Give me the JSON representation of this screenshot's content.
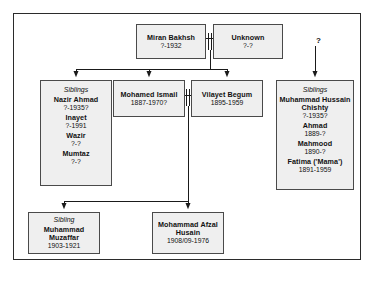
{
  "diagram": {
    "type": "family-tree",
    "title": "",
    "unknown_link_label": "?",
    "nodes": [
      {
        "id": "miran",
        "kind": "person",
        "name": "Miran Bakhsh",
        "dates": "?-1932"
      },
      {
        "id": "unknown",
        "kind": "person",
        "name": "Unknown",
        "dates": "?-?"
      },
      {
        "id": "siblings_left",
        "kind": "sibling-group",
        "header": "Siblings",
        "members": [
          {
            "name": "Nazir Ahmad",
            "dates": "?-1935?"
          },
          {
            "name": "Inayet",
            "dates": "?-1991"
          },
          {
            "name": "Wazir",
            "dates": "?-?"
          },
          {
            "name": "Mumtaz",
            "dates": "?-?"
          }
        ]
      },
      {
        "id": "ismail",
        "kind": "person",
        "name": "Mohamed Ismail",
        "dates": "1887-1970?"
      },
      {
        "id": "vilayet",
        "kind": "person",
        "name": "Vilayet Begum",
        "dates": "1895-1959"
      },
      {
        "id": "siblings_right",
        "kind": "sibling-group",
        "header": "Siblings",
        "members": [
          {
            "name": "Muhammad Hussain Chishty",
            "dates": "?-1935?"
          },
          {
            "name": "Ahmad",
            "dates": "1889-?"
          },
          {
            "name": "Mahmood",
            "dates": "1890-?"
          },
          {
            "name": "Fatima ('Mama')",
            "dates": "1891-1959"
          }
        ]
      },
      {
        "id": "muzaffar",
        "kind": "sibling-group",
        "header": "Sibling",
        "name": "Muhammad Muzaffar",
        "dates": "1903-1921"
      },
      {
        "id": "afzal",
        "kind": "person",
        "name": "Mohammad Afzal Husain",
        "dates": "1908/09-1976"
      }
    ],
    "edges": [
      {
        "from": "miran",
        "to": "unknown",
        "kind": "marriage"
      },
      {
        "from": "miran+unknown",
        "to": "siblings_left",
        "kind": "child"
      },
      {
        "from": "miran+unknown",
        "to": "ismail",
        "kind": "child"
      },
      {
        "from": "miran+unknown",
        "to": "vilayet",
        "kind": "child"
      },
      {
        "from": "?",
        "to": "siblings_right",
        "kind": "child"
      },
      {
        "from": "ismail",
        "to": "vilayet",
        "kind": "marriage"
      },
      {
        "from": "ismail+vilayet",
        "to": "muzaffar",
        "kind": "child"
      },
      {
        "from": "ismail+vilayet",
        "to": "afzal",
        "kind": "child"
      }
    ],
    "colors": {
      "node_fill": "#efefef",
      "node_border": "#4a4a4a",
      "line": "#1a1a1a",
      "frame": "#2b2b2b",
      "text": "#111111"
    }
  }
}
